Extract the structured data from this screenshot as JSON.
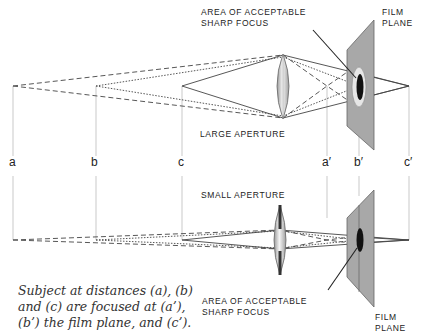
{
  "diagram": {
    "top_panel": {
      "aperture_label": "LARGE APERTURE",
      "focus_label": [
        "AREA OF ACCEPTABLE",
        "SHARP FOCUS"
      ],
      "film_plane_label": [
        "FILM",
        "PLANE"
      ]
    },
    "bottom_panel": {
      "aperture_label": "SMALL APERTURE",
      "focus_label": [
        "AREA OF ACCEPTABLE",
        "SHARP FOCUS"
      ],
      "film_plane_label": [
        "FILM",
        "PLANE"
      ]
    },
    "distance_labels": {
      "subject": [
        "a",
        "b",
        "c"
      ],
      "image": [
        "a′",
        "b′",
        "c′"
      ]
    },
    "caption": [
      "Subject at distances (a), (b)",
      "and (c) are focused at (a’),",
      "(b’) the film plane, and (c’)."
    ],
    "colors": {
      "film_plane": "#a8a8a8",
      "focus_area": "#111111",
      "lines": "#444444",
      "guide_lines": "#bbbbbb"
    }
  }
}
